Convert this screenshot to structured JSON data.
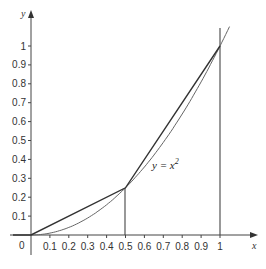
{
  "chart_data": {
    "type": "line",
    "title": "",
    "xlabel": "x",
    "ylabel": "y",
    "xlim": [
      0,
      1.1
    ],
    "ylim": [
      0,
      1.15
    ],
    "grid": false,
    "x_ticks": [
      "0.1",
      "0.2",
      "0.3",
      "0.4",
      "0.5",
      "0.6",
      "0.7",
      "0.8",
      "0.9",
      "1"
    ],
    "y_ticks": [
      "0.1",
      "0.2",
      "0.3",
      "0.4",
      "0.5",
      "0.6",
      "0.7",
      "0.8",
      "0.9",
      "1"
    ],
    "origin_label": "0",
    "series": [
      {
        "name": "y = x^2",
        "kind": "curve",
        "x": [
          0,
          0.1,
          0.2,
          0.3,
          0.4,
          0.5,
          0.6,
          0.7,
          0.8,
          0.9,
          1,
          1.05
        ],
        "values": [
          0,
          0.01,
          0.04,
          0.09,
          0.16,
          0.25,
          0.36,
          0.49,
          0.64,
          0.81,
          1,
          1.1025
        ]
      },
      {
        "name": "chord",
        "kind": "polyline",
        "x": [
          0,
          0.5,
          1
        ],
        "values": [
          0,
          0.25,
          1
        ]
      }
    ],
    "vertical_lines": [
      0.5,
      1
    ],
    "annotations": [
      {
        "text": "y = x²",
        "x": 0.72,
        "y": 0.45
      }
    ]
  },
  "labels": {
    "x_axis": "x",
    "y_axis": "y",
    "origin": "0",
    "curve_label_base": "y = x",
    "curve_label_sup": "2"
  }
}
